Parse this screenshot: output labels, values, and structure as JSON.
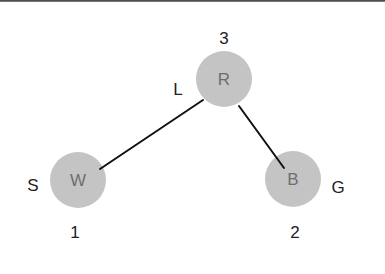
{
  "diagram": {
    "type": "tree-graph",
    "colors": {
      "node_fill": "#c4c4c4",
      "node_text": "#6e6e6e",
      "label_text": "#222222",
      "edge": "#111111",
      "top_border": "#3a3a3a"
    },
    "nodes": [
      {
        "id": "R",
        "letter": "R",
        "number": "3",
        "side_label": "L",
        "cx": 224,
        "cy": 79,
        "r": 28,
        "number_pos": {
          "x": 224,
          "y": 38
        },
        "side_pos": {
          "x": 178,
          "y": 89
        }
      },
      {
        "id": "W",
        "letter": "W",
        "number": "1",
        "side_label": "S",
        "cx": 78,
        "cy": 180,
        "r": 28,
        "number_pos": {
          "x": 75,
          "y": 232
        },
        "side_pos": {
          "x": 33,
          "y": 185
        }
      },
      {
        "id": "B",
        "letter": "B",
        "number": "2",
        "side_label": "G",
        "cx": 293,
        "cy": 179,
        "r": 28,
        "number_pos": {
          "x": 295,
          "y": 232
        },
        "side_pos": {
          "x": 338,
          "y": 187
        }
      }
    ],
    "edges": [
      {
        "from": "R",
        "to": "W",
        "x1": 203,
        "y1": 100,
        "x2": 100,
        "y2": 169
      },
      {
        "from": "R",
        "to": "B",
        "x1": 239,
        "y1": 106,
        "x2": 284,
        "y2": 168
      }
    ]
  }
}
